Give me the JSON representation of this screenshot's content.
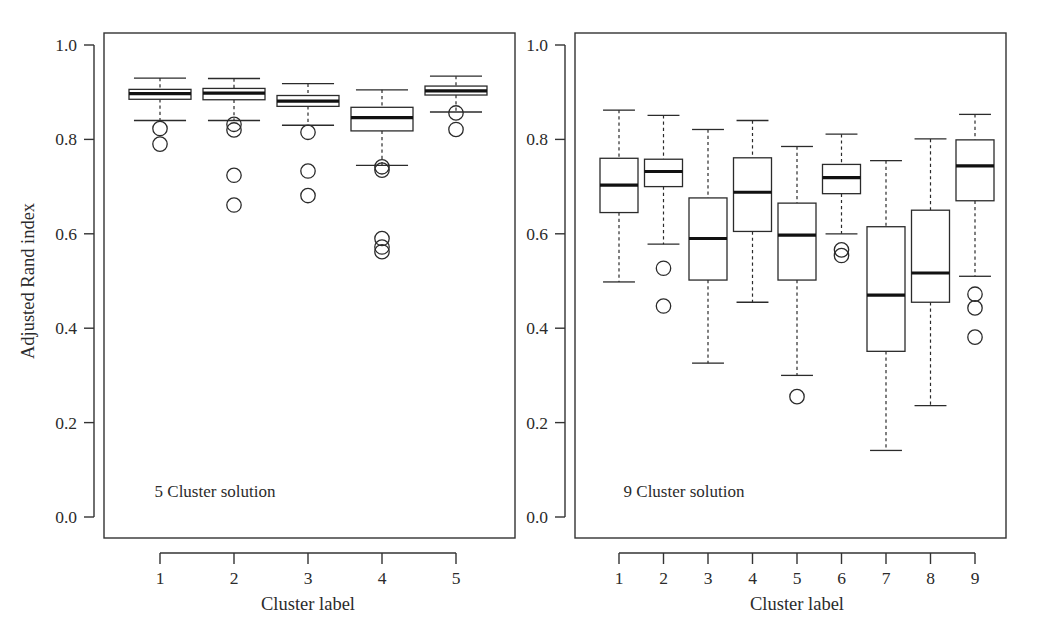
{
  "figure": {
    "width": 1049,
    "height": 634,
    "background": "#ffffff",
    "ink_color": "#2b2b2b"
  },
  "chart_data": [
    {
      "type": "box",
      "panel_id": "left",
      "title": "",
      "annotation": "5 Cluster solution",
      "xlabel": "Cluster label",
      "ylabel": "Adjusted Rand index",
      "categories": [
        "1",
        "2",
        "3",
        "4",
        "5"
      ],
      "ylim": [
        0.0,
        1.0
      ],
      "yticks": [
        0.0,
        0.2,
        0.4,
        0.6,
        0.8,
        1.0
      ],
      "ytick_labels": [
        "0.0",
        "0.2",
        "0.4",
        "0.6",
        "0.8",
        "1.0"
      ],
      "grid": false,
      "legend": "none",
      "boxes": [
        {
          "label": "1",
          "whisker_low": 0.84,
          "q1": 0.885,
          "median": 0.897,
          "q3": 0.906,
          "whisker_high": 0.93,
          "outliers": [
            0.823,
            0.79
          ]
        },
        {
          "label": "2",
          "whisker_low": 0.84,
          "q1": 0.884,
          "median": 0.898,
          "q3": 0.908,
          "whisker_high": 0.929,
          "outliers": [
            0.832,
            0.82,
            0.724,
            0.661
          ]
        },
        {
          "label": "3",
          "whisker_low": 0.83,
          "q1": 0.87,
          "median": 0.881,
          "q3": 0.893,
          "whisker_high": 0.918,
          "outliers": [
            0.815,
            0.733,
            0.681
          ]
        },
        {
          "label": "4",
          "whisker_low": 0.745,
          "q1": 0.818,
          "median": 0.846,
          "q3": 0.868,
          "whisker_high": 0.905,
          "outliers": [
            0.742,
            0.735,
            0.59,
            0.572,
            0.562
          ]
        },
        {
          "label": "5",
          "whisker_low": 0.858,
          "q1": 0.894,
          "median": 0.903,
          "q3": 0.913,
          "whisker_high": 0.934,
          "outliers": [
            0.856,
            0.821
          ]
        }
      ]
    },
    {
      "type": "box",
      "panel_id": "right",
      "title": "",
      "annotation": "9 Cluster solution",
      "xlabel": "Cluster label",
      "ylabel": "",
      "categories": [
        "1",
        "2",
        "3",
        "4",
        "5",
        "6",
        "7",
        "8",
        "9"
      ],
      "ylim": [
        0.0,
        1.0
      ],
      "yticks": [
        0.0,
        0.2,
        0.4,
        0.6,
        0.8,
        1.0
      ],
      "ytick_labels": [
        "0.0",
        "0.2",
        "0.4",
        "0.6",
        "0.8",
        "1.0"
      ],
      "grid": false,
      "legend": "none",
      "boxes": [
        {
          "label": "1",
          "whisker_low": 0.498,
          "q1": 0.645,
          "median": 0.703,
          "q3": 0.76,
          "whisker_high": 0.862,
          "outliers": []
        },
        {
          "label": "2",
          "whisker_low": 0.578,
          "q1": 0.7,
          "median": 0.732,
          "q3": 0.758,
          "whisker_high": 0.851,
          "outliers": [
            0.527,
            0.447
          ]
        },
        {
          "label": "3",
          "whisker_low": 0.326,
          "q1": 0.502,
          "median": 0.59,
          "q3": 0.676,
          "whisker_high": 0.821,
          "outliers": []
        },
        {
          "label": "4",
          "whisker_low": 0.455,
          "q1": 0.605,
          "median": 0.688,
          "q3": 0.761,
          "whisker_high": 0.84,
          "outliers": []
        },
        {
          "label": "5",
          "whisker_low": 0.3,
          "q1": 0.502,
          "median": 0.597,
          "q3": 0.665,
          "whisker_high": 0.785,
          "outliers": [
            0.255
          ]
        },
        {
          "label": "6",
          "whisker_low": 0.6,
          "q1": 0.685,
          "median": 0.719,
          "q3": 0.747,
          "whisker_high": 0.811,
          "outliers": [
            0.566,
            0.554
          ]
        },
        {
          "label": "7",
          "whisker_low": 0.141,
          "q1": 0.351,
          "median": 0.47,
          "q3": 0.615,
          "whisker_high": 0.755,
          "outliers": []
        },
        {
          "label": "8",
          "whisker_low": 0.236,
          "q1": 0.455,
          "median": 0.517,
          "q3": 0.65,
          "whisker_high": 0.801,
          "outliers": []
        },
        {
          "label": "9",
          "whisker_low": 0.51,
          "q1": 0.67,
          "median": 0.744,
          "q3": 0.799,
          "whisker_high": 0.853,
          "outliers": [
            0.472,
            0.443,
            0.381
          ]
        }
      ]
    }
  ],
  "panels": {
    "left": {
      "annotation": "5 Cluster solution",
      "xlabel": "Cluster label",
      "ylabel": "Adjusted Rand index"
    },
    "right": {
      "annotation": "9 Cluster solution",
      "xlabel": "Cluster label",
      "ylabel": ""
    }
  }
}
